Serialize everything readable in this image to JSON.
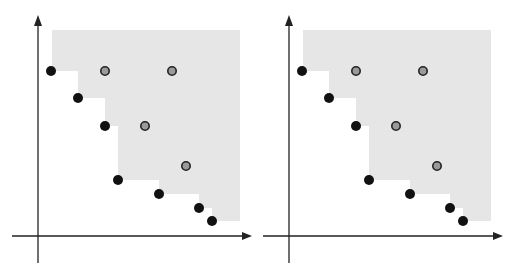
{
  "chart_data": [
    {
      "type": "scatter",
      "title": "",
      "xlabel": "",
      "ylabel": "",
      "panel": "left",
      "axes": {
        "origin": [
          38,
          236
        ],
        "x_end": 252,
        "y_end": 15,
        "x_start": 12,
        "y_bottom": 263
      },
      "shaded_region": {
        "color": "#e6e6e6",
        "top": 30,
        "right": 240,
        "bottom": 221,
        "staircase": [
          [
            52,
            30
          ],
          [
            52,
            71
          ],
          [
            78,
            71
          ],
          [
            78,
            98
          ],
          [
            105,
            98
          ],
          [
            105,
            126
          ],
          [
            118,
            126
          ],
          [
            118,
            180
          ],
          [
            159,
            180
          ],
          [
            159,
            194
          ],
          [
            199,
            194
          ],
          [
            199,
            208
          ],
          [
            212,
            208
          ],
          [
            212,
            221
          ]
        ]
      },
      "nondominated_points": [
        [
          51,
          71
        ],
        [
          78,
          98
        ],
        [
          105,
          126
        ],
        [
          118,
          180
        ],
        [
          159,
          194
        ],
        [
          199,
          208
        ],
        [
          212,
          221
        ]
      ],
      "dominated_points": [
        [
          105,
          71
        ],
        [
          172,
          71
        ],
        [
          145,
          126
        ],
        [
          186,
          166
        ]
      ]
    },
    {
      "type": "scatter",
      "title": "",
      "xlabel": "",
      "ylabel": "",
      "panel": "right",
      "offset_x": 251
    }
  ],
  "colors": {
    "axis": "#222222",
    "nondominated_fill": "#111111",
    "dominated_fill": "#9a9a9a",
    "dominated_stroke": "#222222",
    "shade": "#e6e6e6"
  }
}
